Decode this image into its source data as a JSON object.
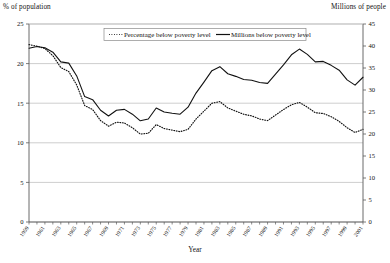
{
  "chart_data": {
    "type": "line",
    "title": "",
    "xlabel": "Year",
    "ylabel": "% of population",
    "y2label": "Millions of people",
    "grid": true,
    "legend_position": "top-center",
    "ylim": [
      0,
      25
    ],
    "y2lim": [
      0,
      45
    ],
    "yticks": [
      0,
      5,
      10,
      15,
      20,
      25
    ],
    "y2ticks": [
      0,
      5,
      10,
      15,
      20,
      25,
      30,
      35,
      40,
      45
    ],
    "xlim": [
      1959,
      2001
    ],
    "x": [
      1959,
      1960,
      1961,
      1962,
      1963,
      1964,
      1965,
      1966,
      1967,
      1968,
      1969,
      1970,
      1971,
      1972,
      1973,
      1974,
      1975,
      1976,
      1977,
      1978,
      1979,
      1980,
      1981,
      1982,
      1983,
      1984,
      1985,
      1986,
      1987,
      1988,
      1989,
      1990,
      1991,
      1992,
      1993,
      1994,
      1995,
      1996,
      1997,
      1998,
      1999,
      2000,
      2001
    ],
    "xtick_labels": [
      "1959",
      "1961",
      "1963",
      "1965",
      "1967",
      "1969",
      "1971",
      "1973",
      "1975",
      "1977",
      "1979",
      "1981",
      "1983",
      "1985",
      "1987",
      "1989",
      "1991",
      "1993",
      "1995",
      "1997",
      "1999",
      "2001"
    ],
    "series": [
      {
        "name": "Percentage below poverty level",
        "axis": "left",
        "style": "dotted",
        "units": "%",
        "values": [
          22.4,
          22.2,
          21.9,
          21.0,
          19.5,
          19.0,
          17.3,
          14.7,
          14.2,
          12.8,
          12.1,
          12.6,
          12.5,
          11.9,
          11.1,
          11.2,
          12.3,
          11.8,
          11.6,
          11.4,
          11.7,
          13.0,
          14.0,
          15.0,
          15.2,
          14.4,
          14.0,
          13.6,
          13.4,
          13.0,
          12.8,
          13.5,
          14.2,
          14.8,
          15.1,
          14.5,
          13.8,
          13.7,
          13.3,
          12.7,
          11.9,
          11.3,
          11.7
        ]
      },
      {
        "name": "Millions below poverty level",
        "axis": "right",
        "style": "solid",
        "units": "millions",
        "values": [
          39.5,
          39.9,
          39.6,
          38.6,
          36.4,
          36.1,
          33.2,
          28.5,
          27.8,
          25.4,
          24.1,
          25.4,
          25.6,
          24.5,
          23.0,
          23.4,
          25.9,
          25.0,
          24.7,
          24.5,
          26.1,
          29.3,
          31.8,
          34.4,
          35.3,
          33.7,
          33.1,
          32.4,
          32.2,
          31.7,
          31.5,
          33.6,
          35.7,
          38.0,
          39.3,
          38.1,
          36.4,
          36.5,
          35.6,
          34.5,
          32.3,
          31.1,
          32.9
        ]
      }
    ]
  },
  "legend": {
    "entries": [
      {
        "label": "Percentage below poverty level",
        "style": "dotted"
      },
      {
        "label": "Millions below poverty level",
        "style": "solid"
      }
    ]
  },
  "axes": {
    "left_title": "% of population",
    "right_title": "Millions of people",
    "x_title": "Year"
  },
  "colors": {
    "line": "#111111",
    "grid": "#b9b9b9",
    "axis": "#5a5a5a",
    "background": "#ffffff"
  }
}
